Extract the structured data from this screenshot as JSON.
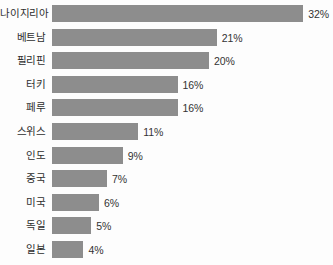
{
  "chart_data": {
    "type": "bar",
    "orientation": "horizontal",
    "title": "",
    "subtitle": "",
    "xlabel": "",
    "ylabel": "",
    "grid": false,
    "legend": false,
    "axis_visible": false,
    "xlim": [
      0,
      32
    ],
    "value_suffix": "%",
    "bar_color": "#8d8d8d",
    "label_color": "#2e2e2e",
    "value_color": "#333333",
    "background_color": "#fdfdfd",
    "categories": [
      "나이지리아",
      "베트남",
      "필리핀",
      "터키",
      "페루",
      "스위스",
      "인도",
      "중국",
      "미국",
      "독일",
      "일본"
    ],
    "values": [
      32,
      21,
      20,
      16,
      16,
      11,
      9,
      7,
      6,
      5,
      4
    ],
    "value_labels": [
      "32%",
      "21%",
      "20%",
      "16%",
      "16%",
      "11%",
      "9%",
      "7%",
      "6%",
      "5%",
      "4%"
    ],
    "bars": [
      {
        "category": "나이지리아",
        "value": 32,
        "label": "32%"
      },
      {
        "category": "베트남",
        "value": 21,
        "label": "21%"
      },
      {
        "category": "필리핀",
        "value": 20,
        "label": "20%"
      },
      {
        "category": "터키",
        "value": 16,
        "label": "16%"
      },
      {
        "category": "페루",
        "value": 16,
        "label": "16%"
      },
      {
        "category": "스위스",
        "value": 11,
        "label": "11%"
      },
      {
        "category": "인도",
        "value": 9,
        "label": "9%"
      },
      {
        "category": "중국",
        "value": 7,
        "label": "7%"
      },
      {
        "category": "미국",
        "value": 6,
        "label": "6%"
      },
      {
        "category": "독일",
        "value": 5,
        "label": "5%"
      },
      {
        "category": "일본",
        "value": 4,
        "label": "4%"
      }
    ]
  },
  "layout": {
    "bar_origin_x": 52,
    "first_row_top": 5,
    "row_pitch": 23.6,
    "bar_height": 17,
    "px_per_unit": 7.85,
    "value_gap": 5
  }
}
